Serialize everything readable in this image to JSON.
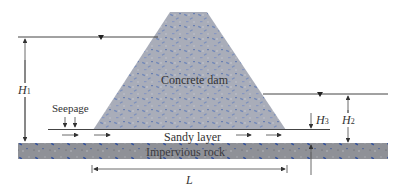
{
  "diagram": {
    "labels": {
      "dam": "Concrete dam",
      "seepage": "Seepage",
      "sandy_layer": "Sandy layer",
      "rock": "Impervious rock",
      "H1": "H",
      "H1_sub": "1",
      "H2": "H",
      "H2_sub": "2",
      "H3": "H",
      "H3_sub": "3",
      "L": "L"
    },
    "colors": {
      "concrete": "#a8acb8",
      "concrete_speck": "#5a78b0",
      "rock": "#8e9096",
      "rock_speck": "#2a4a9a",
      "line": "#444444"
    }
  }
}
